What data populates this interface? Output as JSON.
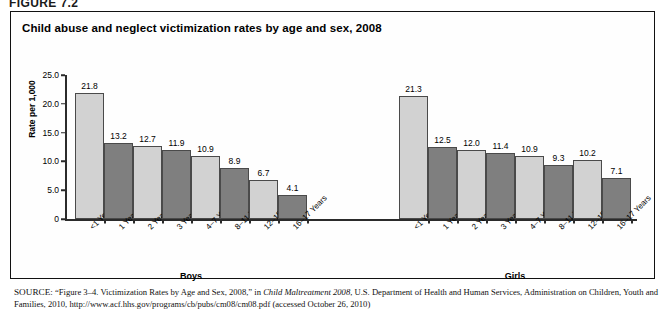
{
  "figure": {
    "number_label": "FIGURE 7.2",
    "title": "Child abuse and neglect victimization rates by age and sex, 2008"
  },
  "chart_data": {
    "type": "bar",
    "title": "Child abuse and neglect victimization rates by age and sex, 2008",
    "xlabel": "",
    "ylabel": "Rate per 1,000",
    "ylim": [
      0,
      25
    ],
    "ytick_labels": [
      "0",
      "5.0",
      "10.0",
      "15.0",
      "20.0",
      "25.0"
    ],
    "ytick_values": [
      0,
      5,
      10,
      15,
      20,
      25
    ],
    "grid": false,
    "legend": "none",
    "categories": [
      "<1 Years",
      "1 Years",
      "2 Years",
      "3 Years",
      "4–7 Years",
      "8–11 Years",
      "12–15 Years",
      "16–17 Years"
    ],
    "groups": [
      {
        "name": "Boys",
        "values": [
          21.8,
          13.2,
          12.7,
          11.9,
          10.9,
          8.9,
          6.7,
          4.1
        ],
        "value_labels": [
          "21.8",
          "13.2",
          "12.7",
          "11.9",
          "10.9",
          "8.9",
          "6.7",
          "4.1"
        ]
      },
      {
        "name": "Girls",
        "values": [
          21.3,
          12.5,
          12.0,
          11.4,
          10.9,
          9.3,
          10.2,
          7.1
        ],
        "value_labels": [
          "21.3",
          "12.5",
          "12.0",
          "11.4",
          "10.9",
          "9.3",
          "10.2",
          "7.1"
        ]
      }
    ],
    "bar_colors": [
      "#d2d2d2",
      "#7f7f7f"
    ],
    "bar_border_color": "#4a4a4a",
    "axis_color": "#2b2b2b"
  },
  "source": {
    "label": "SOURCE:",
    "line1_pre": " “Figure 3–4. Victimization Rates by Age and Sex, 2008,” in ",
    "line1_italic": "Child Maltreatment 2008",
    "line1_post": ", U.S. Department of Health and Human Services,",
    "line2": "Administration on Children, Youth and Families, 2010, http://www.acf.hhs.gov/programs/cb/pubs/cm08/cm08.pdf (accessed October 26, 2010)"
  }
}
